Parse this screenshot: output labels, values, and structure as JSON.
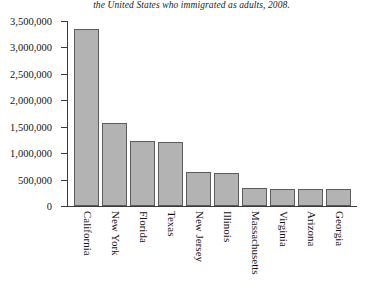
{
  "caption": "the United States who immigrated as adults, 2008.",
  "chart_data": {
    "type": "bar",
    "title": "the United States who immigrated as adults, 2008.",
    "xlabel": "",
    "ylabel": "",
    "grid": false,
    "legend": false,
    "ylim": [
      0,
      3500000
    ],
    "ytick_values": [
      0,
      500000,
      1000000,
      1500000,
      2000000,
      2500000,
      3000000,
      3500000
    ],
    "ytick_labels": [
      "0",
      "500,000",
      "1,000,000",
      "1,500,000",
      "2,000,000",
      "2,500,000",
      "3,000,000",
      "3,500,000"
    ],
    "categories": [
      "California",
      "New York",
      "Florida",
      "Texas",
      "New Jersey",
      "Illinois",
      "Massachusetts",
      "Virginia",
      "Arizona",
      "Georgia"
    ],
    "values": [
      3350000,
      1570000,
      1230000,
      1210000,
      640000,
      625000,
      340000,
      330000,
      330000,
      320000
    ],
    "bar_fill_color": "#b3b3b3",
    "bar_edge_color": "#5c5c5c",
    "axis_color": "#3a3a3a"
  }
}
